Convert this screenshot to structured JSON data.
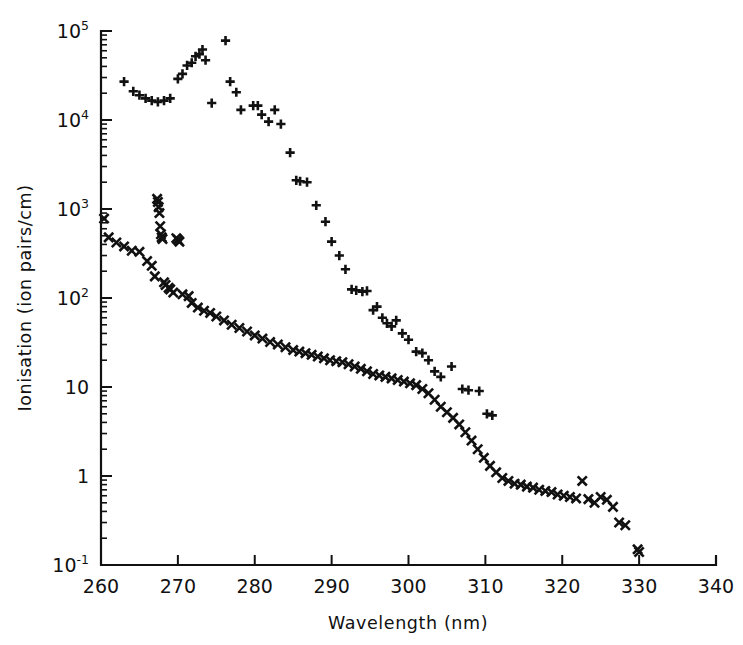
{
  "figure": {
    "background_color": "#ffffff",
    "ink_color": "#111111"
  },
  "chart_data": {
    "type": "scatter",
    "title": "",
    "xlabel": "Wavelength (nm)",
    "ylabel": "Ionisation (ion pairs/cm)",
    "xlim": [
      260,
      340
    ],
    "ylim": [
      0.1,
      100000
    ],
    "yscale": "log",
    "xscale": "linear",
    "grid": false,
    "legend": "none",
    "xticks": [
      260,
      270,
      280,
      290,
      300,
      310,
      320,
      330,
      340
    ],
    "xtick_labels": [
      "260",
      "270",
      "280",
      "290",
      "300",
      "310",
      "320",
      "330",
      "340"
    ],
    "yticks": [
      0.1,
      1,
      10,
      100,
      1000,
      10000,
      100000
    ],
    "ytick_labels": [
      "10⁻¹",
      "1",
      "10",
      "10²",
      "10³",
      "10⁴",
      "10⁵"
    ],
    "ytick_mantissas": [
      "10",
      "1",
      "10",
      "10",
      "10",
      "10",
      "10"
    ],
    "ytick_exponents": [
      "-1",
      "",
      "",
      "2",
      "3",
      "4",
      "5"
    ],
    "series": [
      {
        "name": "upper-series",
        "marker": "plus",
        "marker_label": "+",
        "color": "#111111",
        "points": [
          [
            263.0,
            27000
          ],
          [
            264.2,
            21000
          ],
          [
            265.0,
            19000
          ],
          [
            265.8,
            17500
          ],
          [
            266.6,
            16500
          ],
          [
            267.4,
            16000
          ],
          [
            268.2,
            16500
          ],
          [
            269.0,
            17500
          ],
          [
            270.0,
            29000
          ],
          [
            270.6,
            33000
          ],
          [
            271.2,
            41000
          ],
          [
            271.8,
            44000
          ],
          [
            272.3,
            52000
          ],
          [
            272.8,
            55000
          ],
          [
            273.2,
            62000
          ],
          [
            273.6,
            47000
          ],
          [
            274.4,
            15500
          ],
          [
            276.2,
            78000
          ],
          [
            276.8,
            27000
          ],
          [
            277.6,
            20500
          ],
          [
            278.2,
            13000
          ],
          [
            279.8,
            14500
          ],
          [
            280.4,
            14500
          ],
          [
            280.9,
            11500
          ],
          [
            281.8,
            9600
          ],
          [
            282.6,
            13000
          ],
          [
            283.4,
            9000
          ],
          [
            284.6,
            4300
          ],
          [
            285.4,
            2100
          ],
          [
            285.9,
            2050
          ],
          [
            286.8,
            2000
          ],
          [
            288.0,
            1100
          ],
          [
            289.2,
            720
          ],
          [
            290.0,
            430
          ],
          [
            291.0,
            300
          ],
          [
            291.8,
            210
          ],
          [
            292.6,
            125
          ],
          [
            293.2,
            122
          ],
          [
            294.0,
            118
          ],
          [
            294.6,
            120
          ],
          [
            295.4,
            73
          ],
          [
            295.9,
            80
          ],
          [
            296.6,
            60
          ],
          [
            297.2,
            52
          ],
          [
            297.8,
            48
          ],
          [
            298.4,
            56
          ],
          [
            299.2,
            40
          ],
          [
            300.0,
            34
          ],
          [
            301.0,
            25
          ],
          [
            301.8,
            24
          ],
          [
            302.6,
            20
          ],
          [
            303.4,
            15
          ],
          [
            304.2,
            13
          ],
          [
            305.6,
            17
          ],
          [
            307.0,
            9.5
          ],
          [
            307.8,
            9.2
          ],
          [
            309.2,
            9.0
          ],
          [
            310.2,
            5.0
          ],
          [
            310.9,
            4.8
          ]
        ]
      },
      {
        "name": "lower-series",
        "marker": "cross",
        "marker_label": "×",
        "color": "#111111",
        "points": [
          [
            260.4,
            780
          ],
          [
            261.0,
            480
          ],
          [
            262.0,
            420
          ],
          [
            263.0,
            380
          ],
          [
            264.0,
            340
          ],
          [
            265.0,
            330
          ],
          [
            266.0,
            260
          ],
          [
            266.6,
            230
          ],
          [
            267.0,
            175
          ],
          [
            267.3,
            1300
          ],
          [
            267.4,
            1200
          ],
          [
            267.5,
            1050
          ],
          [
            267.6,
            900
          ],
          [
            267.7,
            640
          ],
          [
            267.8,
            520
          ],
          [
            267.9,
            480
          ],
          [
            268.0,
            460
          ],
          [
            268.2,
            150
          ],
          [
            268.4,
            140
          ],
          [
            268.8,
            130
          ],
          [
            269.0,
            125
          ],
          [
            269.4,
            115
          ],
          [
            269.8,
            470
          ],
          [
            270.0,
            450
          ],
          [
            270.2,
            430
          ],
          [
            270.6,
            110
          ],
          [
            271.4,
            105
          ],
          [
            271.8,
            88
          ],
          [
            272.6,
            78
          ],
          [
            273.4,
            72
          ],
          [
            274.2,
            68
          ],
          [
            275.0,
            62
          ],
          [
            276.0,
            56
          ],
          [
            277.0,
            50
          ],
          [
            278.0,
            46
          ],
          [
            279.0,
            42
          ],
          [
            280.0,
            38
          ],
          [
            281.0,
            35
          ],
          [
            282.0,
            32
          ],
          [
            283.0,
            30
          ],
          [
            284.0,
            28
          ],
          [
            285.0,
            26
          ],
          [
            285.8,
            25
          ],
          [
            286.6,
            24
          ],
          [
            287.4,
            23
          ],
          [
            288.2,
            22
          ],
          [
            289.0,
            21
          ],
          [
            289.8,
            20
          ],
          [
            290.6,
            19.5
          ],
          [
            291.4,
            19
          ],
          [
            292.2,
            18
          ],
          [
            293.0,
            17
          ],
          [
            293.8,
            16
          ],
          [
            294.6,
            15
          ],
          [
            295.4,
            14
          ],
          [
            296.2,
            13.5
          ],
          [
            297.0,
            13
          ],
          [
            297.8,
            12.5
          ],
          [
            298.6,
            12
          ],
          [
            299.4,
            11.5
          ],
          [
            300.2,
            11
          ],
          [
            301.0,
            10.5
          ],
          [
            301.8,
            9.5
          ],
          [
            302.6,
            8.5
          ],
          [
            303.4,
            7.2
          ],
          [
            304.2,
            6.0
          ],
          [
            305.0,
            5.2
          ],
          [
            305.8,
            4.5
          ],
          [
            306.6,
            3.8
          ],
          [
            307.4,
            3.1
          ],
          [
            308.2,
            2.5
          ],
          [
            309.0,
            2.0
          ],
          [
            309.8,
            1.6
          ],
          [
            310.6,
            1.3
          ],
          [
            311.4,
            1.1
          ],
          [
            312.2,
            0.95
          ],
          [
            313.0,
            0.88
          ],
          [
            313.8,
            0.82
          ],
          [
            314.6,
            0.8
          ],
          [
            315.4,
            0.76
          ],
          [
            316.2,
            0.74
          ],
          [
            317.0,
            0.7
          ],
          [
            317.8,
            0.68
          ],
          [
            318.6,
            0.66
          ],
          [
            319.4,
            0.62
          ],
          [
            320.2,
            0.6
          ],
          [
            321.0,
            0.58
          ],
          [
            321.8,
            0.56
          ],
          [
            322.6,
            0.88
          ],
          [
            323.4,
            0.55
          ],
          [
            324.2,
            0.5
          ],
          [
            325.0,
            0.58
          ],
          [
            325.8,
            0.54
          ],
          [
            326.6,
            0.45
          ],
          [
            327.4,
            0.3
          ],
          [
            328.2,
            0.28
          ],
          [
            329.8,
            0.15
          ],
          [
            330.0,
            0.14
          ]
        ]
      }
    ]
  },
  "axes_geometry": {
    "left_px": 101,
    "right_px": 716,
    "top_px": 31,
    "bottom_px": 565
  }
}
